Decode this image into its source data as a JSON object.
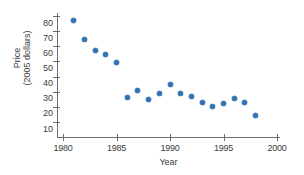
{
  "chart_data": {
    "type": "scatter",
    "title": "",
    "xlabel": "Year",
    "ylabel": "Price (2005 dollars)",
    "ylabel_lines": [
      "Price",
      "(2005 dollars)"
    ],
    "xlim": [
      1980,
      2000
    ],
    "ylim": [
      10,
      80
    ],
    "xticks": [
      1980,
      1985,
      1990,
      1995,
      2000
    ],
    "yticks": [
      10,
      20,
      30,
      40,
      50,
      60,
      70,
      80
    ],
    "xtick_labels": [
      "1980",
      "1985",
      "1990",
      "1995",
      "2000"
    ],
    "ytick_labels": [
      "10",
      "20",
      "30",
      "40",
      "50",
      "60",
      "70",
      "80"
    ],
    "grid": false,
    "legend": false,
    "marker_color": "#2e74b5",
    "axis_color": "#6e6e6e",
    "x": [
      1981,
      1982,
      1983,
      1984,
      1985,
      1986,
      1987,
      1988,
      1989,
      1990,
      1991,
      1992,
      1993,
      1994,
      1995,
      1996,
      1997,
      1998
    ],
    "y": [
      77,
      64.5,
      57.5,
      54.5,
      49,
      26,
      31,
      25,
      29,
      34.5,
      29,
      27,
      23,
      20.5,
      22,
      25.5,
      23,
      14.5
    ],
    "points": [
      {
        "x": 1981,
        "y": 77
      },
      {
        "x": 1982,
        "y": 64.5
      },
      {
        "x": 1983,
        "y": 57.5
      },
      {
        "x": 1984,
        "y": 54.5
      },
      {
        "x": 1985,
        "y": 49
      },
      {
        "x": 1986,
        "y": 26
      },
      {
        "x": 1987,
        "y": 31
      },
      {
        "x": 1988,
        "y": 25
      },
      {
        "x": 1989,
        "y": 29
      },
      {
        "x": 1990,
        "y": 34.5
      },
      {
        "x": 1991,
        "y": 29
      },
      {
        "x": 1992,
        "y": 27
      },
      {
        "x": 1993,
        "y": 23
      },
      {
        "x": 1994,
        "y": 20.5
      },
      {
        "x": 1995,
        "y": 22
      },
      {
        "x": 1996,
        "y": 25.5
      },
      {
        "x": 1997,
        "y": 23
      },
      {
        "x": 1998,
        "y": 14.5
      }
    ]
  }
}
